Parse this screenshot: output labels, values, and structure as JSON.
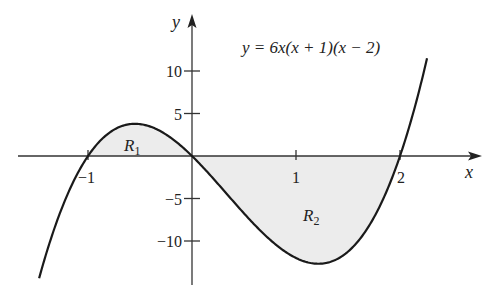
{
  "chart_data": {
    "type": "line",
    "title": "",
    "equation_label": "y = 6x(x + 1)(x − 2)",
    "function": "6x(x+1)(x-2)",
    "xlabel": "x",
    "ylabel": "y",
    "xlim": [
      -1.47,
      2.26
    ],
    "ylim": [
      -14.5,
      16.5
    ],
    "x_ticks": [
      -1,
      1,
      2
    ],
    "x_tick_labels": [
      "−1",
      "1",
      "2"
    ],
    "y_ticks": [
      10,
      5,
      -5,
      -10
    ],
    "y_tick_labels": [
      "10",
      "5",
      "−5",
      "−10"
    ],
    "grid": false,
    "legend": "none",
    "roots": [
      -1,
      0,
      2
    ],
    "local_max": {
      "x": -0.55,
      "y": 3.79
    },
    "local_min": {
      "x": 1.22,
      "y": -12.68
    },
    "shaded_regions": [
      {
        "name": "R1",
        "label": "R",
        "subscript": "1",
        "x_range": [
          -1,
          0
        ],
        "description": "area between curve and x-axis above the axis"
      },
      {
        "name": "R2",
        "label": "R",
        "subscript": "2",
        "x_range": [
          0,
          2
        ],
        "description": "area between curve and x-axis below the axis"
      }
    ],
    "colors": {
      "curve": "#1a1a1a",
      "axis": "#333333",
      "shade": "#ececec"
    }
  }
}
